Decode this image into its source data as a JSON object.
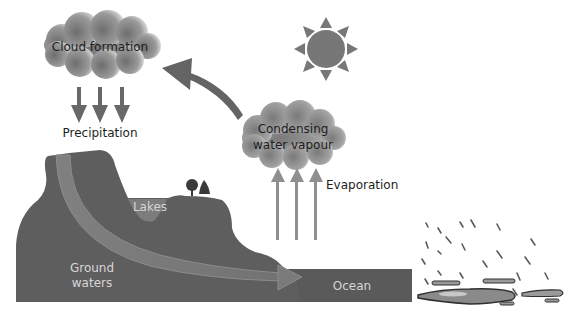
{
  "diagram": {
    "labels": {
      "cloud_formation": "Cloud formation",
      "precipitation": "Precipitation",
      "condensing_line1": "Condensing",
      "condensing_line2": "water vapour",
      "evaporation": "Evaporation",
      "lakes": "Lakes",
      "ground_line1": "Ground",
      "ground_line2": "waters",
      "ocean": "Ocean"
    },
    "icons": [
      "cloud-icon",
      "sun-icon",
      "tree-icon",
      "rain-icon"
    ],
    "colors": {
      "land": "#5e5e5e",
      "ocean": "#5a5a5a",
      "lake": "#7c7c7c",
      "arrow": "#6a6a6a",
      "evaporation_arrow": "#8f8f8f",
      "sun": "#777777",
      "groundwater_flow": "#7a7a7a"
    }
  }
}
